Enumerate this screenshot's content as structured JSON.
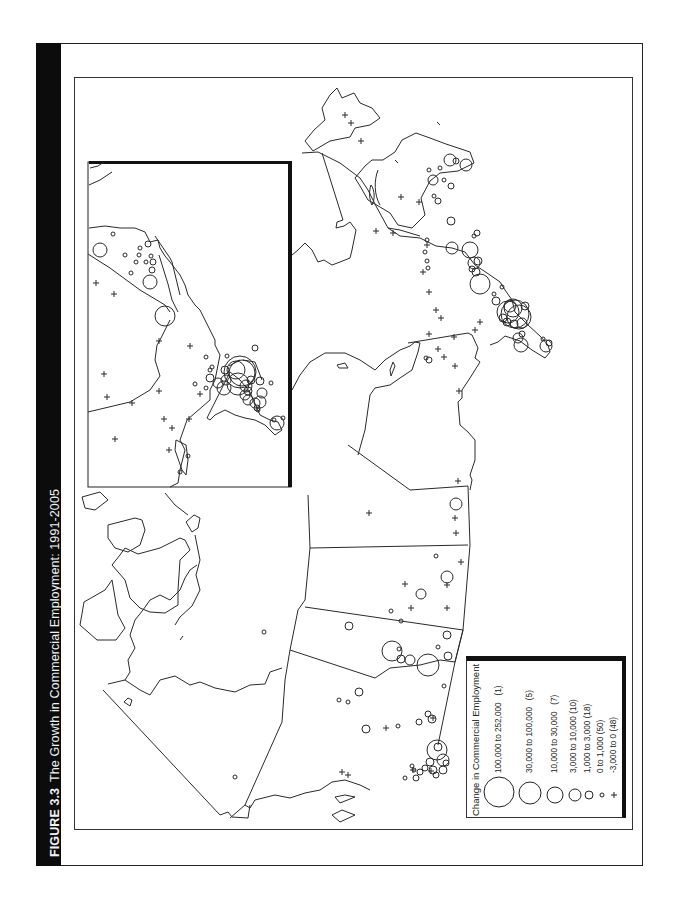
{
  "figure": {
    "number": "FIGURE 3.3",
    "title": "The Growth in Commercial Employment: 1991-2005"
  },
  "legend": {
    "title": "Change in Commercial Employment",
    "classes": [
      {
        "range": "100,000 to 252,000",
        "count": "(1)",
        "symbol": "circle-xl"
      },
      {
        "range": "30,000 to 100,000",
        "count": "(5)",
        "symbol": "circle-l"
      },
      {
        "range": "10,000 to 30,000",
        "count": "(7)",
        "symbol": "circle-m"
      },
      {
        "range": "3,000 to 10,000",
        "count": "(10)",
        "symbol": "circle-s"
      },
      {
        "range": "1,000 to 3,000",
        "count": "(18)",
        "symbol": "circle-xs"
      },
      {
        "range": "0 to 1,000",
        "count": "(50)",
        "symbol": "circle-xxs"
      },
      {
        "range": "-3,000 to 0",
        "count": "(48)",
        "symbol": "plus"
      }
    ]
  },
  "map": {
    "type": "proportional-symbol map",
    "region": "Canada (rotated 90°, with inset of Southern Ontario/Quebec corridor)",
    "colors": {
      "ink": "#222222",
      "background": "#ffffff",
      "title_bar": "#0c0c0c"
    }
  }
}
